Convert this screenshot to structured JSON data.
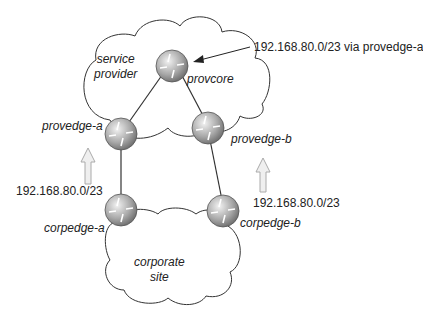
{
  "clouds": {
    "service_provider": {
      "line1": "service",
      "line2": "provider"
    },
    "corporate_site": {
      "line1": "corporate",
      "line2": "site"
    }
  },
  "routers": {
    "provcore": "provcore",
    "provedge_a": "provedge-a",
    "provedge_b": "provedge-b",
    "corpedge_a": "corpedge-a",
    "corpedge_b": "corpedge-b"
  },
  "annotations": {
    "route_via": "192.168.80.0/23 via provedge-a",
    "advert_left": "192.168.80.0/23",
    "advert_right": "192.168.80.0/23"
  },
  "colors": {
    "line": "#333333",
    "router_fill_light": "#e6e6e6",
    "router_fill_dark": "#7a7a7a",
    "arrow_fill": "#efefef",
    "arrow_stroke": "#aaaaaa"
  }
}
